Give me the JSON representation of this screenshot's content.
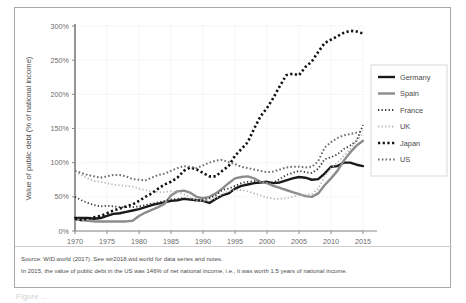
{
  "figure": {
    "notes": {
      "source": "Source: WID.world (2017). See wir2018.wid.world for data series and notes.",
      "detail": "In 2015, the value of public debt in the US was 146% of net national income, i.e., it was worth 1.5 years of national income."
    },
    "caption_partial": "Figure ..."
  },
  "chart_data": {
    "type": "line",
    "title": "",
    "xlabel": "",
    "ylabel": "Value of public debt (% of national income)",
    "xlim": [
      1970,
      2015
    ],
    "ylim": [
      0,
      300
    ],
    "xticks": [
      "1970",
      "1975",
      "1980",
      "1985",
      "1990",
      "1995",
      "2000",
      "2005",
      "2010",
      "2015"
    ],
    "yticks": [
      "0%",
      "50%",
      "100%",
      "150%",
      "200%",
      "250%",
      "300%"
    ],
    "grid": true,
    "legend_position": "right",
    "x": [
      1970,
      1971,
      1972,
      1973,
      1974,
      1975,
      1976,
      1977,
      1978,
      1979,
      1980,
      1981,
      1982,
      1983,
      1984,
      1985,
      1986,
      1987,
      1988,
      1989,
      1990,
      1991,
      1992,
      1993,
      1994,
      1995,
      1996,
      1997,
      1998,
      1999,
      2000,
      2001,
      2002,
      2003,
      2004,
      2005,
      2006,
      2007,
      2008,
      2009,
      2010,
      2011,
      2012,
      2013,
      2014,
      2015
    ],
    "series": [
      {
        "name": "Germany",
        "color": "#1a1a1a",
        "style": "solid",
        "width": 2.4,
        "values": [
          19,
          19,
          19,
          18,
          19,
          22,
          25,
          26,
          28,
          30,
          32,
          35,
          38,
          40,
          42,
          44,
          45,
          47,
          46,
          45,
          44,
          41,
          47,
          52,
          55,
          62,
          66,
          68,
          70,
          71,
          72,
          70,
          71,
          74,
          77,
          79,
          78,
          75,
          76,
          84,
          94,
          95,
          100,
          100,
          97,
          95
        ]
      },
      {
        "name": "Spain",
        "color": "#8c8c8c",
        "style": "solid",
        "width": 2.4,
        "values": [
          17,
          16,
          15,
          14,
          14,
          14,
          14,
          14,
          14,
          15,
          22,
          27,
          31,
          35,
          40,
          52,
          58,
          59,
          56,
          50,
          48,
          50,
          55,
          62,
          70,
          77,
          79,
          80,
          77,
          72,
          70,
          66,
          63,
          60,
          57,
          54,
          51,
          50,
          55,
          67,
          77,
          88,
          103,
          115,
          125,
          132
        ]
      },
      {
        "name": "France",
        "color": "#333333",
        "style": "dotted-fine",
        "width": 1.8,
        "values": [
          50,
          45,
          41,
          38,
          36,
          37,
          36,
          35,
          35,
          35,
          36,
          38,
          40,
          42,
          44,
          46,
          47,
          48,
          47,
          46,
          46,
          48,
          52,
          60,
          62,
          66,
          70,
          72,
          73,
          72,
          71,
          71,
          76,
          82,
          85,
          88,
          86,
          85,
          91,
          105,
          108,
          112,
          120,
          125,
          132,
          155
        ]
      },
      {
        "name": "UK",
        "color": "#b5b5b5",
        "style": "dotted-fine",
        "width": 1.8,
        "values": [
          86,
          82,
          77,
          73,
          72,
          70,
          68,
          67,
          66,
          65,
          62,
          60,
          58,
          57,
          57,
          58,
          57,
          54,
          49,
          45,
          44,
          45,
          48,
          54,
          58,
          60,
          60,
          58,
          55,
          52,
          49,
          47,
          47,
          48,
          50,
          53,
          53,
          54,
          62,
          80,
          92,
          100,
          110,
          120,
          132,
          143
        ]
      },
      {
        "name": "Japan",
        "color": "#111111",
        "style": "dotted-bold",
        "width": 2.6,
        "values": [
          18,
          16,
          18,
          20,
          22,
          26,
          30,
          33,
          36,
          39,
          44,
          50,
          55,
          62,
          68,
          72,
          78,
          88,
          93,
          90,
          85,
          80,
          80,
          88,
          95,
          110,
          120,
          130,
          150,
          168,
          180,
          195,
          212,
          228,
          230,
          228,
          240,
          248,
          262,
          275,
          280,
          285,
          290,
          293,
          292,
          289
        ]
      },
      {
        "name": "US",
        "color": "#6e6e6e",
        "style": "dotted-med",
        "width": 2.0,
        "values": [
          88,
          85,
          82,
          80,
          78,
          80,
          82,
          82,
          80,
          76,
          75,
          74,
          78,
          82,
          84,
          88,
          92,
          95,
          94,
          92,
          96,
          100,
          103,
          104,
          101,
          98,
          94,
          92,
          90,
          88,
          86,
          87,
          90,
          93,
          94,
          94,
          93,
          94,
          102,
          122,
          130,
          136,
          140,
          142,
          144,
          146
        ]
      }
    ]
  }
}
